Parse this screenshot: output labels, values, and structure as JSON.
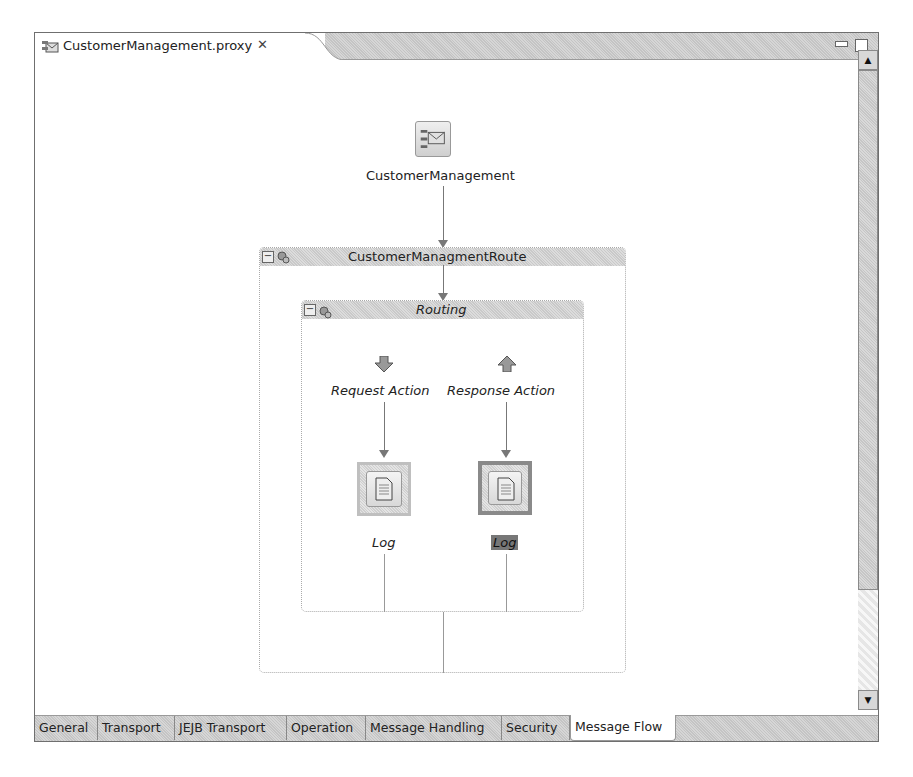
{
  "editor": {
    "tab_title": "CustomerManagement.proxy",
    "tab_icon": "proxy-service-icon",
    "close_icon": "close-icon",
    "minimize_icon": "minimize-icon",
    "maximize_icon": "maximize-icon"
  },
  "flow": {
    "proxy_node": {
      "label": "CustomerManagement",
      "icon": "proxy-envelope-icon"
    },
    "route_node": {
      "label": "CustomerManagmentRoute",
      "icon": "route-node-icon"
    },
    "routing_node": {
      "label": "Routing",
      "icon": "routing-icon"
    },
    "request_action": {
      "label": "Request Action",
      "icon": "arrow-down-icon"
    },
    "response_action": {
      "label": "Response Action",
      "icon": "arrow-up-icon"
    },
    "request_log": {
      "label": "Log",
      "icon": "log-document-icon",
      "selected": false
    },
    "response_log": {
      "label": "Log",
      "icon": "log-document-icon",
      "selected": true
    }
  },
  "scrollbar": {
    "up": "▲",
    "down": "▼"
  },
  "bottom_tabs": [
    {
      "label": "General",
      "active": false
    },
    {
      "label": "Transport",
      "active": false
    },
    {
      "label": "JEJB Transport",
      "active": false
    },
    {
      "label": "Operation",
      "active": false
    },
    {
      "label": "Message Handling",
      "active": false
    },
    {
      "label": "Security",
      "active": false
    },
    {
      "label": "Message Flow",
      "active": true
    }
  ]
}
